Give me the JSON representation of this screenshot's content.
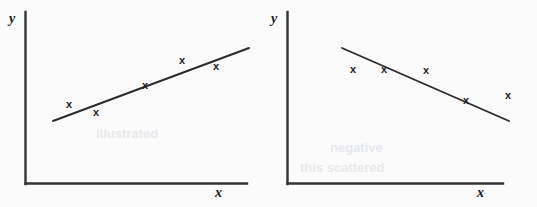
{
  "figure": {
    "type": "scatter-pair",
    "background_color": "#fbfbfb",
    "ink_color": "#262626",
    "width": 537,
    "height": 207,
    "ghost_text": [
      {
        "text": "illustrated",
        "x": 96,
        "y": 126,
        "size": 13
      },
      {
        "text": "this scattered",
        "x": 300,
        "y": 160,
        "size": 13
      },
      {
        "text": "negative",
        "x": 330,
        "y": 140,
        "size": 13
      }
    ]
  },
  "chart_data": [
    {
      "type": "scatter",
      "title": "",
      "subtitle": "Positive linear relationship",
      "xlabel": "x",
      "ylabel": "y",
      "grid": false,
      "legend": "none",
      "axis": {
        "origin_px": [
          25,
          184
        ],
        "x_end_px": [
          247,
          184
        ],
        "y_top_px": [
          25,
          12
        ],
        "xlim": [
          0,
          1
        ],
        "ylim": [
          0,
          1
        ]
      },
      "trend_line": {
        "label": "line of best fit",
        "slope_sign": "positive",
        "start_px": [
          53,
          121
        ],
        "end_px": [
          249,
          48
        ]
      },
      "points": [
        {
          "label": "x",
          "px": [
            69,
            104
          ]
        },
        {
          "label": "x",
          "px": [
            96,
            112
          ]
        },
        {
          "label": "x",
          "px": [
            145,
            85
          ]
        },
        {
          "label": "x",
          "px": [
            182,
            60
          ]
        },
        {
          "label": "x",
          "px": [
            216,
            66
          ]
        }
      ]
    },
    {
      "type": "scatter",
      "title": "",
      "subtitle": "Negative linear relationship",
      "xlabel": "x",
      "ylabel": "y",
      "grid": false,
      "legend": "none",
      "axis": {
        "origin_px": [
          18,
          184
        ],
        "x_end_px": [
          234,
          184
        ],
        "y_top_px": [
          18,
          12
        ],
        "xlim": [
          0,
          1
        ],
        "ylim": [
          0,
          1
        ]
      },
      "trend_line": {
        "label": "line of best fit",
        "slope_sign": "negative",
        "start_px": [
          73,
          48
        ],
        "end_px": [
          240,
          121
        ]
      },
      "points": [
        {
          "label": "x",
          "px": [
            84,
            69
          ]
        },
        {
          "label": "x",
          "px": [
            115,
            69
          ]
        },
        {
          "label": "x",
          "px": [
            157,
            70
          ]
        },
        {
          "label": "x",
          "px": [
            197,
            100
          ]
        },
        {
          "label": "x",
          "px": [
            239,
            95
          ]
        }
      ]
    }
  ],
  "panels": [
    {
      "name": "left-scatter-plot",
      "x_axis_label": "x",
      "y_axis_label": "y"
    },
    {
      "name": "right-scatter-plot",
      "x_axis_label": "x",
      "y_axis_label": "y"
    }
  ]
}
